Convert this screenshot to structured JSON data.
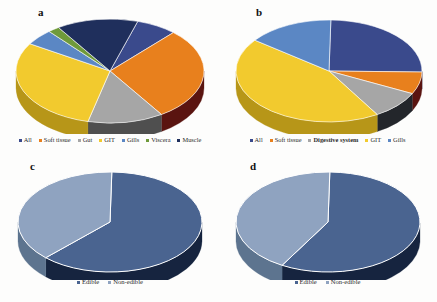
{
  "figure": {
    "panels": [
      {
        "id": "a",
        "label": "a",
        "legend": [
          {
            "label": "All",
            "color": "#3a4a8c"
          },
          {
            "label": "Soft tissue",
            "color": "#e8801d"
          },
          {
            "label": "Gut",
            "color": "#a6a6a6"
          },
          {
            "label": "GIT",
            "color": "#f2ca2e"
          },
          {
            "label": "Gills",
            "color": "#5b87c4"
          },
          {
            "label": "Viscera",
            "color": "#6f9a3a"
          },
          {
            "label": "Muscle",
            "color": "#1f2f5c"
          }
        ]
      },
      {
        "id": "b",
        "label": "b",
        "legend": [
          {
            "label": "All",
            "color": "#3a4a8c"
          },
          {
            "label": "Soft tissue",
            "color": "#e8801d"
          },
          {
            "label": "Digestive system",
            "color": "#a6a6a6"
          },
          {
            "label": "GIT",
            "color": "#f2ca2e"
          },
          {
            "label": "Gills",
            "color": "#5b87c4"
          }
        ]
      },
      {
        "id": "c",
        "label": "c",
        "legend": [
          {
            "label": "Edible",
            "color": "#4a6490"
          },
          {
            "label": "Non-edible",
            "color": "#8fa3c0"
          }
        ]
      },
      {
        "id": "d",
        "label": "d",
        "legend": [
          {
            "label": "Edible",
            "color": "#4a6490"
          },
          {
            "label": "Non-edible",
            "color": "#8fa3c0"
          }
        ]
      }
    ]
  },
  "chart_data": [
    {
      "type": "pie",
      "panel": "a",
      "title": "a",
      "labels": [
        "All",
        "Soft tissue",
        "Gut",
        "GIT",
        "Gills",
        "Viscera",
        "Muscle"
      ],
      "values": [
        7,
        29,
        13,
        30,
        5,
        2,
        14
      ],
      "colors": [
        "#3a4a8c",
        "#e8801d",
        "#a6a6a6",
        "#f2ca2e",
        "#5b87c4",
        "#6f9a3a",
        "#1f2f5c"
      ],
      "side_colors": [
        "#232d57",
        "#5a1410",
        "#4f4f4f",
        "#b79618",
        "#3a5a85",
        "#4a6826",
        "#141d39"
      ],
      "legend_position": "bottom",
      "grid": false,
      "threeD": true
    },
    {
      "type": "pie",
      "panel": "b",
      "title": "b",
      "labels": [
        "All",
        "Soft tissue",
        "Digestive system",
        "GIT",
        "Gills"
      ],
      "values": [
        25,
        7,
        9,
        44,
        15
      ],
      "colors": [
        "#3a4a8c",
        "#e8801d",
        "#a6a6a6",
        "#f2ca2e",
        "#5b87c4"
      ],
      "side_colors": [
        "#232d57",
        "#5a1410",
        "#23262b",
        "#b79618",
        "#3a5a85"
      ],
      "legend_position": "bottom",
      "grid": false,
      "threeD": true
    },
    {
      "type": "pie",
      "panel": "c",
      "title": "c",
      "labels": [
        "Edible",
        "Non-edible"
      ],
      "values": [
        62,
        38
      ],
      "colors": [
        "#4a6490",
        "#8fa3c0"
      ],
      "side_colors": [
        "#16243f",
        "#5d748f"
      ],
      "legend_position": "bottom",
      "grid": false,
      "threeD": true
    },
    {
      "type": "pie",
      "panel": "d",
      "title": "d",
      "labels": [
        "Edible",
        "Non-edible"
      ],
      "values": [
        58,
        42
      ],
      "colors": [
        "#4a6490",
        "#8fa3c0"
      ],
      "side_colors": [
        "#16243f",
        "#5d748f"
      ],
      "legend_position": "bottom",
      "grid": false,
      "threeD": true
    }
  ]
}
